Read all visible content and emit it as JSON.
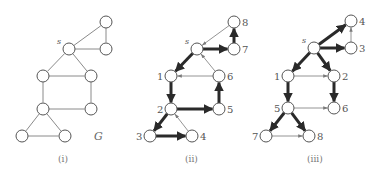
{
  "colors": {
    "node_stroke": "#555555",
    "thick_edge": "#2a2a2a",
    "thin_edge": "#7a7a7a",
    "text": "#555555"
  },
  "panels": [
    {
      "id": "i",
      "caption": "(i)",
      "graph_label": "G",
      "source_label": "s",
      "directed": false,
      "nodes": [
        {
          "id": "a",
          "x": 106,
          "y": 22,
          "label": ""
        },
        {
          "id": "s",
          "x": 69,
          "y": 49,
          "label": "s"
        },
        {
          "id": "b",
          "x": 106,
          "y": 49,
          "label": ""
        },
        {
          "id": "c",
          "x": 43,
          "y": 76,
          "label": ""
        },
        {
          "id": "d",
          "x": 91,
          "y": 76,
          "label": ""
        },
        {
          "id": "e",
          "x": 43,
          "y": 109,
          "label": ""
        },
        {
          "id": "f",
          "x": 91,
          "y": 109,
          "label": ""
        },
        {
          "id": "g",
          "x": 22,
          "y": 136,
          "label": ""
        },
        {
          "id": "h",
          "x": 65,
          "y": 136,
          "label": ""
        }
      ],
      "edges": [
        [
          "s",
          "a"
        ],
        [
          "a",
          "b"
        ],
        [
          "s",
          "b"
        ],
        [
          "s",
          "c"
        ],
        [
          "s",
          "d"
        ],
        [
          "c",
          "d"
        ],
        [
          "c",
          "e"
        ],
        [
          "d",
          "f"
        ],
        [
          "e",
          "f"
        ],
        [
          "e",
          "g"
        ],
        [
          "e",
          "h"
        ],
        [
          "g",
          "h"
        ]
      ]
    },
    {
      "id": "ii",
      "caption": "(ii)",
      "source_label": "s",
      "directed": true,
      "nodes": [
        {
          "id": "8",
          "x": 234,
          "y": 22,
          "label": "8"
        },
        {
          "id": "s",
          "x": 197,
          "y": 49,
          "label": "s"
        },
        {
          "id": "7",
          "x": 234,
          "y": 49,
          "label": "7"
        },
        {
          "id": "1",
          "x": 171,
          "y": 76,
          "label": "1"
        },
        {
          "id": "6",
          "x": 219,
          "y": 76,
          "label": "6"
        },
        {
          "id": "2",
          "x": 171,
          "y": 109,
          "label": "2"
        },
        {
          "id": "5",
          "x": 219,
          "y": 109,
          "label": "5"
        },
        {
          "id": "3",
          "x": 150,
          "y": 136,
          "label": "3"
        },
        {
          "id": "4",
          "x": 192,
          "y": 136,
          "label": "4"
        }
      ],
      "edges": [
        {
          "from": "8",
          "to": "s",
          "weight": "thin"
        },
        {
          "from": "s",
          "to": "7",
          "weight": "thick"
        },
        {
          "from": "7",
          "to": "8",
          "weight": "thick"
        },
        {
          "from": "s",
          "to": "1",
          "weight": "thick"
        },
        {
          "from": "6",
          "to": "1",
          "weight": "thin"
        },
        {
          "from": "6",
          "to": "s",
          "weight": "thin"
        },
        {
          "from": "1",
          "to": "2",
          "weight": "thick"
        },
        {
          "from": "5",
          "to": "6",
          "weight": "thick"
        },
        {
          "from": "2",
          "to": "5",
          "weight": "thick"
        },
        {
          "from": "2",
          "to": "3",
          "weight": "thick"
        },
        {
          "from": "3",
          "to": "4",
          "weight": "thick"
        },
        {
          "from": "4",
          "to": "2",
          "weight": "thin"
        }
      ]
    },
    {
      "id": "iii",
      "caption": "(iii)",
      "source_label": "s",
      "directed": true,
      "nodes": [
        {
          "id": "4",
          "x": 351,
          "y": 21,
          "label": "4"
        },
        {
          "id": "s",
          "x": 314,
          "y": 48,
          "label": "s"
        },
        {
          "id": "3",
          "x": 351,
          "y": 48,
          "label": "3"
        },
        {
          "id": "1",
          "x": 288,
          "y": 76,
          "label": "1"
        },
        {
          "id": "2",
          "x": 334,
          "y": 76,
          "label": "2"
        },
        {
          "id": "5",
          "x": 288,
          "y": 108,
          "label": "5"
        },
        {
          "id": "6",
          "x": 334,
          "y": 108,
          "label": "6"
        },
        {
          "id": "7",
          "x": 266,
          "y": 136,
          "label": "7"
        },
        {
          "id": "8",
          "x": 309,
          "y": 136,
          "label": "8"
        }
      ],
      "edges": [
        {
          "from": "s",
          "to": "4",
          "weight": "thick"
        },
        {
          "from": "s",
          "to": "3",
          "weight": "thick"
        },
        {
          "from": "3",
          "to": "4",
          "weight": "thin"
        },
        {
          "from": "s",
          "to": "1",
          "weight": "thick"
        },
        {
          "from": "s",
          "to": "2",
          "weight": "thick"
        },
        {
          "from": "1",
          "to": "2",
          "weight": "thin"
        },
        {
          "from": "1",
          "to": "5",
          "weight": "thick"
        },
        {
          "from": "2",
          "to": "6",
          "weight": "thick"
        },
        {
          "from": "5",
          "to": "6",
          "weight": "thin"
        },
        {
          "from": "5",
          "to": "7",
          "weight": "thick"
        },
        {
          "from": "5",
          "to": "8",
          "weight": "thick"
        },
        {
          "from": "7",
          "to": "8",
          "weight": "thin"
        }
      ]
    }
  ]
}
